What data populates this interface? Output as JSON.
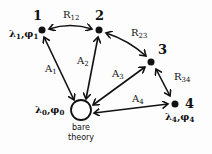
{
  "diagram": {
    "nodes": [
      {
        "id": "1",
        "label": "1",
        "params": "λ1,φ1",
        "x": 42,
        "y": 30
      },
      {
        "id": "2",
        "label": "2",
        "params": "",
        "x": 99,
        "y": 30
      },
      {
        "id": "3",
        "label": "3",
        "params": "",
        "x": 151,
        "y": 62
      },
      {
        "id": "4",
        "label": "4",
        "params": "λ4,φ4",
        "x": 175,
        "y": 104
      },
      {
        "id": "0",
        "label": "bare theory",
        "params": "λ0,φ0",
        "x": 81,
        "y": 110
      }
    ],
    "labels": {
      "node1_num": "1",
      "node1_greek": "λ",
      "node1_sub1": "1",
      "node1_sep": ",φ",
      "node1_sub2": "1",
      "node2_num": "2",
      "node3_num": "3",
      "node4_num": "4",
      "node4_greek": "λ",
      "node4_sub1": "4",
      "node4_sep": ",φ",
      "node4_sub2": "4",
      "node0_greek": "λ",
      "node0_sub1": "0",
      "node0_sep": ",φ",
      "node0_sub2": "0",
      "bare_line1": "bare",
      "bare_line2": "theory",
      "R12": "R",
      "R12_sub": "12",
      "R23": "R",
      "R23_sub": "23",
      "R34": "R",
      "R34_sub": "34",
      "A1": "A",
      "A1_sub": "1",
      "A2": "A",
      "A2_sub": "2",
      "A3": "A",
      "A3_sub": "3",
      "A4": "A",
      "A4_sub": "4"
    },
    "edges": [
      {
        "from": "1",
        "to": "2",
        "label": "R12",
        "type": "bidirectional"
      },
      {
        "from": "2",
        "to": "3",
        "label": "R23",
        "type": "bidirectional"
      },
      {
        "from": "3",
        "to": "4",
        "label": "R34",
        "type": "bidirectional"
      },
      {
        "from": "0",
        "to": "1",
        "label": "A1",
        "type": "bidirectional"
      },
      {
        "from": "0",
        "to": "2",
        "label": "A2",
        "type": "bidirectional"
      },
      {
        "from": "0",
        "to": "3",
        "label": "A3",
        "type": "bidirectional"
      },
      {
        "from": "0",
        "to": "4",
        "label": "A4",
        "type": "bidirectional"
      }
    ]
  }
}
